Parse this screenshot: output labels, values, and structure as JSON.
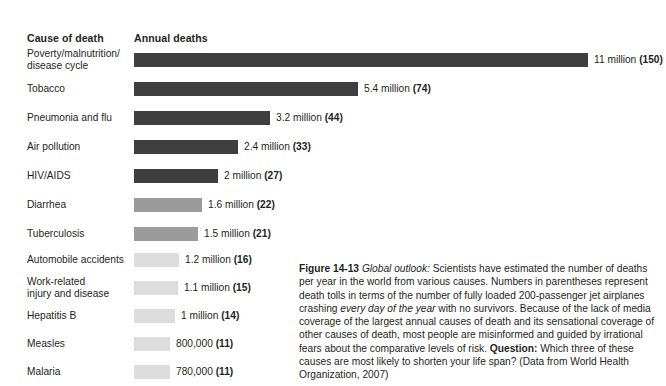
{
  "headers": {
    "cause": "Cause of death",
    "annual": "Annual deaths"
  },
  "chart_data": {
    "type": "bar",
    "title": "Annual deaths",
    "xlabel": "",
    "ylabel": "Cause of death",
    "orientation": "horizontal",
    "grid": false,
    "legend": false,
    "unit": "deaths per year",
    "paren_note": "Numbers in parentheses = fully loaded 200-passenger jets crashing every day of the year",
    "categories": [
      "Poverty/malnutrition/\ndisease cycle",
      "Tobacco",
      "Pneumonia and flu",
      "Air pollution",
      "HIV/AIDS",
      "Diarrhea",
      "Tuberculosis",
      "Automobile accidents",
      "Work-related\ninjury and disease",
      "Hepatitis B",
      "Measles",
      "Malaria"
    ],
    "values": [
      11000000,
      5400000,
      3200000,
      2400000,
      2000000,
      1600000,
      1500000,
      1200000,
      1100000,
      1000000,
      800000,
      780000
    ],
    "value_labels": [
      "11 million",
      "5.4  million",
      "3.2 million",
      "2.4 million",
      "2 million",
      "1.6 million",
      "1.5 million",
      "1.2 million",
      "1.1 million",
      "1 million",
      "800,000",
      "780,000"
    ],
    "paren_values": [
      150,
      74,
      44,
      33,
      27,
      22,
      21,
      16,
      15,
      14,
      11,
      11
    ],
    "paren_labels": [
      "(150)",
      "(74)",
      "(44)",
      "(33)",
      "(27)",
      "(22)",
      "(21)",
      "(16)",
      "(15)",
      "(14)",
      "(11)",
      "(11)"
    ],
    "bar_colors": [
      "#3f3f3f",
      "#3f3f3f",
      "#3f3f3f",
      "#3f3f3f",
      "#3f3f3f",
      "#9b9b9b",
      "#9b9b9b",
      "#dcdcdc",
      "#dcdcdc",
      "#dcdcdc",
      "#dcdcdc",
      "#dcdcdc"
    ],
    "xlim": [
      0,
      11000000
    ]
  },
  "rows": [
    {
      "label": "Poverty/malnutrition/\ndisease cycle",
      "value_label": "11 million",
      "paren": "(150)",
      "bar_width": 454,
      "color": "#3f3f3f",
      "top": 52,
      "label_top": 48
    },
    {
      "label": "Tobacco",
      "value_label": "5.4  million",
      "paren": "(74)",
      "bar_width": 224,
      "color": "#3f3f3f",
      "top": 81,
      "label_top": 83
    },
    {
      "label": "Pneumonia and flu",
      "value_label": "3.2 million",
      "paren": "(44)",
      "bar_width": 136,
      "color": "#3f3f3f",
      "top": 110,
      "label_top": 112
    },
    {
      "label": "Air pollution",
      "value_label": "2.4 million",
      "paren": "(33)",
      "bar_width": 104,
      "color": "#3f3f3f",
      "top": 139,
      "label_top": 141
    },
    {
      "label": "HIV/AIDS",
      "value_label": "2 million",
      "paren": "(27)",
      "bar_width": 84,
      "color": "#3f3f3f",
      "top": 168,
      "label_top": 170
    },
    {
      "label": "Diarrhea",
      "value_label": "1.6 million",
      "paren": "(22)",
      "bar_width": 68,
      "color": "#9b9b9b",
      "top": 197,
      "label_top": 199
    },
    {
      "label": "Tuberculosis",
      "value_label": "1.5 million",
      "paren": "(21)",
      "bar_width": 64,
      "color": "#9b9b9b",
      "top": 226,
      "label_top": 228
    },
    {
      "label": "Automobile accidents",
      "value_label": "1.2 million",
      "paren": "(16)",
      "bar_width": 45,
      "color": "#dcdcdc",
      "top": 252,
      "label_top": 254
    },
    {
      "label": "Work-related\ninjury and disease",
      "value_label": "1.1 million",
      "paren": "(15)",
      "bar_width": 44,
      "color": "#dcdcdc",
      "top": 280,
      "label_top": 276
    },
    {
      "label": "Hepatitis B",
      "value_label": "1 million",
      "paren": "(14)",
      "bar_width": 41,
      "color": "#dcdcdc",
      "top": 308,
      "label_top": 310
    },
    {
      "label": "Measles",
      "value_label": "800,000",
      "paren": "(11)",
      "bar_width": 36,
      "color": "#dcdcdc",
      "top": 336,
      "label_top": 338
    },
    {
      "label": "Malaria",
      "value_label": "780,000",
      "paren": "(11)",
      "bar_width": 36,
      "color": "#dcdcdc",
      "top": 364,
      "label_top": 366
    }
  ],
  "caption": {
    "figure_number": "Figure 14-13",
    "lead_italic": "Global outlook:",
    "body_1": " Scientists have estimated the number of deaths per year in the world from various causes. Numbers in parentheses represent death tolls in terms of the number of fully loaded 200-passenger jet airplanes crashing ",
    "italic_2": "every day of the year",
    "body_2": " with no survivors. Because of the lack of media coverage of the largest annual causes of death and its sensational coverage of other causes of death, most people are misinformed and guided by irrational fears about the comparative levels of risk. ",
    "question_label": "Question:",
    "body_3": " Which three of these causes are most likely to shorten your life span? (Data from World Health Organization, 2007)"
  }
}
